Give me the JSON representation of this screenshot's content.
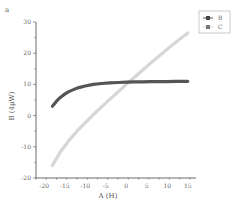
{
  "panel_label": "a",
  "chart_data": {
    "type": "line",
    "title": "",
    "xlabel": "A (H)",
    "ylabel": "B (4μW)",
    "xlim": [
      -22,
      17
    ],
    "ylim": [
      -20,
      30
    ],
    "xticks": [
      -20,
      -15,
      -10,
      -5,
      0,
      5,
      10,
      15
    ],
    "yticks": [
      -20,
      -10,
      0,
      10,
      20,
      30
    ],
    "grid": false,
    "legend_position": "upper right",
    "series": [
      {
        "name": "B",
        "color": "#555555",
        "x": [
          -18,
          -17,
          -16,
          -15,
          -14,
          -12,
          -10,
          -8,
          -6,
          -4,
          -2,
          0,
          2,
          4,
          6,
          8,
          10,
          12,
          15
        ],
        "y": [
          3.0,
          4.6,
          5.9,
          6.9,
          7.7,
          8.8,
          9.5,
          10.0,
          10.3,
          10.5,
          10.6,
          10.7,
          10.8,
          10.8,
          10.9,
          10.9,
          10.9,
          11.0,
          11.0
        ]
      },
      {
        "name": "C",
        "color": "#d6d6d6",
        "x": [
          -18,
          -16,
          -14,
          -12,
          -10,
          -8,
          -6,
          -4,
          -2,
          0,
          2,
          4,
          6,
          8,
          10,
          12,
          15
        ],
        "y": [
          -16.0,
          -11.5,
          -8.0,
          -5.0,
          -2.3,
          0.3,
          2.8,
          5.2,
          7.6,
          10.0,
          12.3,
          14.6,
          16.9,
          19.1,
          21.3,
          23.4,
          26.5
        ]
      }
    ]
  }
}
